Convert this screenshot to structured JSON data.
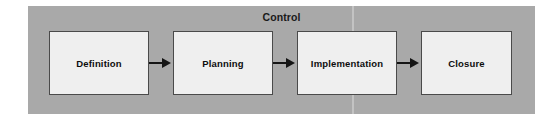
{
  "diagram": {
    "container": {
      "title": "Control",
      "background_color": "#a9a9a9"
    },
    "box_fill_color": "#efefef",
    "box_border_color": "#4a4a4a",
    "arrow_color": "#151515",
    "phases": [
      {
        "label": "Definition"
      },
      {
        "label": "Planning"
      },
      {
        "label": "Implementation"
      },
      {
        "label": "Closure"
      }
    ],
    "connectors": [
      {
        "from": "Definition",
        "to": "Planning",
        "glyph": "arrow-right"
      },
      {
        "from": "Planning",
        "to": "Implementation",
        "glyph": "arrow-right"
      },
      {
        "from": "Implementation",
        "to": "Closure",
        "glyph": "arrow-right"
      }
    ]
  }
}
